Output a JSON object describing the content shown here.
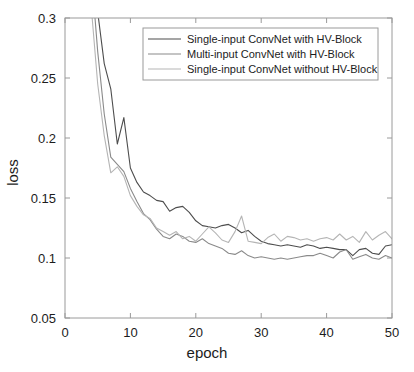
{
  "chart_data": {
    "type": "line",
    "title": "",
    "xlabel": "epoch",
    "ylabel": "loss",
    "xlim": [
      0,
      50
    ],
    "ylim": [
      0.05,
      0.3
    ],
    "xticks": [
      0,
      10,
      20,
      30,
      40,
      50
    ],
    "yticks": [
      0.05,
      0.1,
      0.15,
      0.2,
      0.25,
      0.3
    ],
    "xtick_labels": [
      "0",
      "10",
      "20",
      "30",
      "40",
      "50"
    ],
    "ytick_labels": [
      "0.05",
      "0.1",
      "0.15",
      "0.2",
      "0.25",
      "0.3"
    ],
    "grid": false,
    "legend_position": "top-center-right",
    "background": "#ffffff",
    "axis_color": "#9a9a9a",
    "x": [
      1,
      2,
      3,
      4,
      5,
      6,
      7,
      8,
      9,
      10,
      11,
      12,
      13,
      14,
      15,
      16,
      17,
      18,
      19,
      20,
      21,
      22,
      23,
      24,
      25,
      26,
      27,
      28,
      29,
      30,
      31,
      32,
      33,
      34,
      35,
      36,
      37,
      38,
      39,
      40,
      41,
      42,
      43,
      44,
      45,
      46,
      47,
      48,
      49,
      50
    ],
    "series": [
      {
        "name": "Single-input ConvNet with HV-Block",
        "color": "#4d4d4d",
        "values": [
          0.62,
          0.52,
          0.44,
          0.37,
          0.305,
          0.262,
          0.241,
          0.195,
          0.217,
          0.175,
          0.163,
          0.155,
          0.152,
          0.148,
          0.147,
          0.139,
          0.142,
          0.143,
          0.138,
          0.131,
          0.127,
          0.126,
          0.125,
          0.127,
          0.128,
          0.125,
          0.121,
          0.123,
          0.118,
          0.114,
          0.112,
          0.111,
          0.11,
          0.111,
          0.11,
          0.109,
          0.111,
          0.11,
          0.108,
          0.109,
          0.108,
          0.107,
          0.107,
          0.102,
          0.107,
          0.108,
          0.104,
          0.103,
          0.11,
          0.111
        ]
      },
      {
        "name": "Multi-input ConvNet with HV-Block",
        "color": "#8a8a8a",
        "values": [
          0.6,
          0.5,
          0.42,
          0.34,
          0.272,
          0.22,
          0.184,
          0.178,
          0.172,
          0.158,
          0.147,
          0.137,
          0.132,
          0.124,
          0.118,
          0.116,
          0.12,
          0.118,
          0.114,
          0.113,
          0.116,
          0.112,
          0.11,
          0.108,
          0.104,
          0.103,
          0.106,
          0.102,
          0.1,
          0.101,
          0.1,
          0.099,
          0.1,
          0.099,
          0.1,
          0.101,
          0.102,
          0.102,
          0.104,
          0.102,
          0.1,
          0.105,
          0.107,
          0.099,
          0.101,
          0.103,
          0.1,
          0.099,
          0.102,
          0.1
        ]
      },
      {
        "name": "Single-input ConvNet without HV-Block",
        "color": "#b5b5b5",
        "values": [
          0.58,
          0.47,
          0.39,
          0.31,
          0.245,
          0.202,
          0.171,
          0.176,
          0.168,
          0.152,
          0.143,
          0.136,
          0.133,
          0.125,
          0.122,
          0.119,
          0.122,
          0.116,
          0.118,
          0.114,
          0.12,
          0.126,
          0.121,
          0.115,
          0.113,
          0.122,
          0.135,
          0.114,
          0.113,
          0.112,
          0.117,
          0.12,
          0.114,
          0.118,
          0.117,
          0.115,
          0.116,
          0.114,
          0.116,
          0.117,
          0.115,
          0.12,
          0.115,
          0.118,
          0.113,
          0.122,
          0.115,
          0.119,
          0.122,
          0.116
        ]
      }
    ]
  }
}
